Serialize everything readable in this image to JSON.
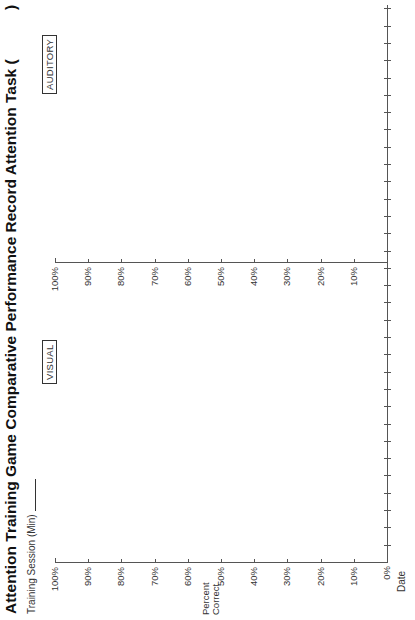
{
  "title": "Attention Training Game Comparative Performance Record Attention Task (",
  "title_close": ")",
  "session_label": "Training Session (Min)",
  "y_axis_label_line1": "Percent",
  "y_axis_label_line2": "Correct",
  "x_axis_label": "Date",
  "zero_label": "0%",
  "panels": [
    {
      "name": "VISUAL",
      "label": "VISUAL"
    },
    {
      "name": "AUDITORY",
      "label": "AUDITORY"
    }
  ],
  "y_ticks": [
    "100%",
    "90%",
    "80%",
    "70%",
    "60%",
    "50%",
    "40%",
    "30%",
    "20%",
    "10%"
  ],
  "chart_data": {
    "type": "line",
    "title": "Attention Training Game Comparative Performance Record Attention Task ( )",
    "xlabel": "Date",
    "ylabel": "Percent Correct",
    "ylim": [
      0,
      100
    ],
    "y_tick_labels": [
      "0%",
      "10%",
      "20%",
      "30%",
      "40%",
      "50%",
      "60%",
      "70%",
      "80%",
      "90%",
      "100%"
    ],
    "panels": [
      "VISUAL",
      "AUDITORY"
    ],
    "series": [
      {
        "name": "VISUAL",
        "values": []
      },
      {
        "name": "AUDITORY",
        "values": []
      }
    ],
    "x_ticks_per_panel": 17,
    "grid": false,
    "note": "Blank record form; no data plotted"
  }
}
